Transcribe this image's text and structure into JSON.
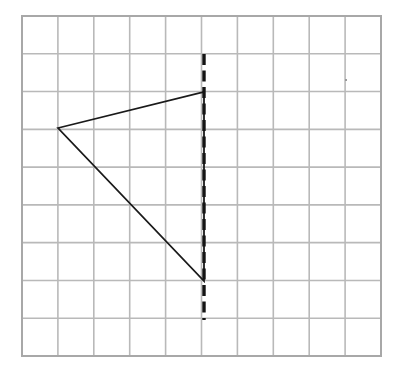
{
  "figure": {
    "title": "Triangle and vertical line of reflection on a grid",
    "background_color": "#ffffff",
    "width": 400,
    "height": 379
  },
  "grid": {
    "name": "coordinate-grid",
    "columns": 10,
    "rows": 9,
    "left_px": 22,
    "top_px": 16,
    "right_px": 381,
    "bottom_px": 356,
    "cell_width_px": 35.9,
    "cell_height_px": 37.78,
    "line_color": "#b9b9b9",
    "border_color": "#a8a8a8",
    "line_width_px": 1.6,
    "border_width_px": 2
  },
  "shapes": {
    "triangle": {
      "name": "triangle",
      "label": "",
      "stroke_color": "#1a1a1a",
      "stroke_width_px": 1.8,
      "fill": "none",
      "closed": true,
      "vertices_grid": [
        {
          "col": 1,
          "row": 3
        },
        {
          "col": 5,
          "row": 2
        },
        {
          "col": 5,
          "row": 7
        }
      ],
      "vertices_px": [
        {
          "x": 58,
          "y": 128
        },
        {
          "x": 204,
          "y": 92
        },
        {
          "x": 204,
          "y": 281
        }
      ]
    },
    "reflection_line": {
      "name": "line-of-reflection",
      "label": "",
      "orientation": "vertical",
      "stroke_color": "#141414",
      "stroke_width_px": 3.4,
      "dash_on_px": 11,
      "dash_off_px": 5.5,
      "grid_col": 5,
      "x_px": 204,
      "y_start_px": 54,
      "y_end_px": 320
    },
    "stray_mark": {
      "name": "stray-dot",
      "color": "#9a9a9a",
      "x_px": 345,
      "y_px": 79,
      "size_px": 2
    }
  },
  "chart_data": {
    "type": "scatter",
    "title": "Triangle and vertical line of reflection on a grid",
    "xlabel": "",
    "ylabel": "",
    "xlim": [
      0,
      10
    ],
    "ylim": [
      0,
      9
    ],
    "grid": true,
    "legend": "none",
    "tick_labels_x": [],
    "tick_labels_y": [],
    "annotations": [],
    "series": [
      {
        "name": "triangle",
        "kind": "closed-polyline",
        "x": [
          1,
          5,
          5,
          1
        ],
        "y": [
          3,
          2,
          7,
          3
        ]
      },
      {
        "name": "line-of-reflection",
        "kind": "dashed-vertical-line",
        "x": [
          5,
          5
        ],
        "y": [
          1,
          8
        ]
      }
    ]
  }
}
